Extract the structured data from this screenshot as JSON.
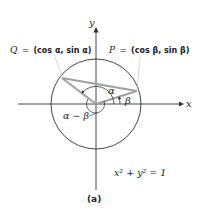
{
  "figure": {
    "caption": "(a)",
    "axes": {
      "x_label": "x",
      "y_label": "y"
    },
    "points": {
      "Q": {
        "name": "Q",
        "eq": "=",
        "coords": "(cos α, sin α)"
      },
      "P": {
        "name": "P",
        "eq": "=",
        "coords": "(cos β, sin β)"
      }
    },
    "angles": {
      "alpha": "α",
      "beta": "β",
      "difference": "α − β"
    },
    "circle_equation": "x² + y² = 1",
    "colors": {
      "circle": "#333333",
      "chord": "#a0a0a0",
      "axes": "#333333"
    }
  }
}
